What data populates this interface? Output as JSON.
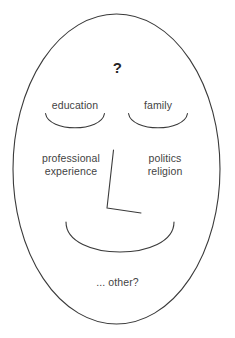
{
  "diagram": {
    "background_color": "#ffffff",
    "stroke_color": "#3a3a3a",
    "text_color": "#434343",
    "question_mark": "?",
    "labels": {
      "forehead": "?",
      "left_eye": "education",
      "right_eye": "family",
      "left_cheek": "professional\nexperience",
      "right_cheek": "politics\nreligion",
      "chin": "... other?"
    },
    "shapes": {
      "head_outline": "ellipse",
      "left_eye": "downward-arc",
      "right_eye": "downward-arc",
      "nose": "L-shaped-polyline",
      "mouth": "smile-arc"
    }
  }
}
